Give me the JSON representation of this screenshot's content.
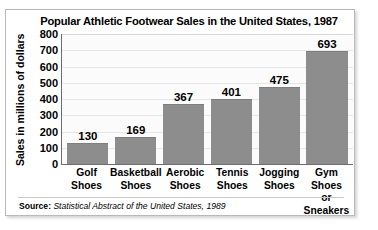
{
  "chart_data": {
    "type": "bar",
    "title": "Popular Athletic Footwear Sales in the United States, 1987",
    "xlabel": "",
    "ylabel": "Sales in millions of dollars",
    "ylim": [
      0,
      800
    ],
    "ytick_step": 100,
    "yticks": [
      "800",
      "700",
      "600",
      "500",
      "400",
      "300",
      "200",
      "100",
      "0"
    ],
    "grid": true,
    "legend": "none",
    "orientation": "vertical",
    "categories": [
      "Golf Shoes",
      "Basketball Shoes",
      "Aerobic Shoes",
      "Tennis Shoes",
      "Jogging Shoes",
      "Gym Shoes or Sneakers"
    ],
    "category_lines": [
      [
        "Golf",
        "Shoes"
      ],
      [
        "Basketball",
        "Shoes"
      ],
      [
        "Aerobic",
        "Shoes"
      ],
      [
        "Tennis",
        "Shoes"
      ],
      [
        "Jogging",
        "Shoes"
      ],
      [
        "Gym Shoes",
        "or Sneakers"
      ]
    ],
    "values": [
      130,
      169,
      367,
      401,
      475,
      693
    ],
    "value_labels": [
      "130",
      "169",
      "367",
      "401",
      "475",
      "693"
    ],
    "bar_color": "#8d8d8d",
    "plot_background": "#fbfbfb",
    "axis_color": "#6d6d6d",
    "gridline_color": "#e6e6e6"
  },
  "source": {
    "label": "Source:",
    "reference": "Statistical Abstract of the United States, 1989"
  }
}
